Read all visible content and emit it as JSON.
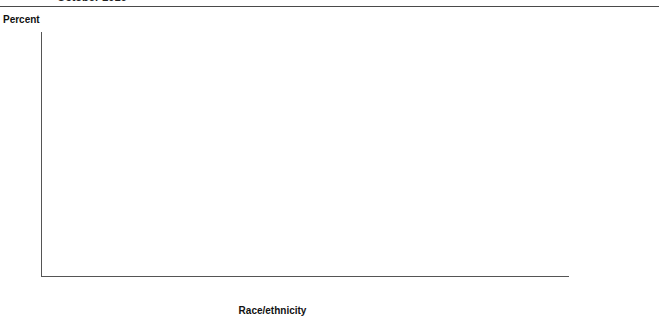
{
  "header": {
    "title": "October 2016"
  },
  "axis": {
    "y_label": "Percent",
    "x_title": "Race/ethnicity",
    "y_ticks": [
      "100",
      "90",
      "80",
      "70",
      "60",
      "50",
      "40",
      "30",
      "20",
      "10",
      "0"
    ]
  },
  "legend": {
    "position": "right",
    "items": [
      {
        "label": "Full-day",
        "color": "#b7b7b7",
        "key": "full"
      },
      {
        "label": "Part-day",
        "color": "#4a4a4a",
        "key": "part"
      }
    ]
  },
  "chart_data": {
    "type": "bar",
    "subtype": "stacked",
    "title": "October 2016",
    "xlabel": "Race/ethnicity",
    "ylabel": "Percent",
    "ylim": [
      0,
      100
    ],
    "ytick_step": 10,
    "grid": true,
    "categories": [
      "White",
      "Black",
      "Hispanic",
      "Asian",
      "Pacific Islander",
      "American Indian/ Alaska Native",
      "Two or more races"
    ],
    "category_lines": [
      [
        "White"
      ],
      [
        "Black"
      ],
      [
        "Hispanic"
      ],
      [
        "Asian"
      ],
      [
        "Pacific",
        "Islander"
      ],
      [
        "American Indian/",
        "Alaska Native"
      ],
      [
        "Two or",
        "more races"
      ]
    ],
    "series": [
      {
        "name": "Part-day",
        "color": "#4a4a4a",
        "values": [
          22,
          9,
          16,
          18,
          null,
          21,
          15
        ],
        "labels": [
          "22",
          "9",
          "16",
          "18",
          "‡",
          "21!",
          "15"
        ]
      },
      {
        "name": "Full-day",
        "color": "#b7b7b7",
        "values": [
          20,
          26,
          19,
          27,
          24,
          20,
          26
        ],
        "labels": [
          "20",
          "26",
          "19",
          "27",
          "24!",
          "20",
          "26"
        ]
      }
    ],
    "totals": [
      42,
      35,
      34,
      45,
      40,
      41,
      41
    ],
    "total_labels": [
      "42",
      "35",
      "34",
      "45",
      "40",
      "41",
      "41"
    ]
  }
}
